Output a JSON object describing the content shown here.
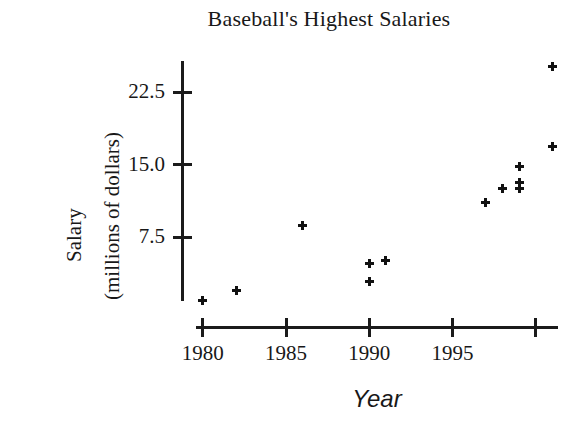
{
  "chart_data": {
    "type": "scatter",
    "title": "Baseball's Highest Salaries",
    "xlabel": "Year",
    "ylabel": "Salary\n(millions of dollars)",
    "ylabel_lines": [
      "Salary",
      "(millions of dollars)"
    ],
    "xlim": [
      1979.0,
      2001.5
    ],
    "ylim": [
      0.0,
      26.5
    ],
    "xticks": [
      1980,
      1985,
      1990,
      1995,
      2000
    ],
    "xtick_labels": [
      "1980",
      "1985",
      "1990",
      "1995",
      ""
    ],
    "yticks": [
      7.5,
      15.0,
      22.5
    ],
    "ytick_labels": [
      "7.5",
      "15.0",
      "22.5"
    ],
    "grid": false,
    "legend": null,
    "marker": "plus",
    "marker_color": "#111111",
    "x": [
      1980,
      1982,
      1986,
      1990,
      1990,
      1991,
      1997,
      1998,
      1999,
      1999,
      1999,
      2001,
      2001
    ],
    "y": [
      1.0,
      2.0,
      8.7,
      4.8,
      2.9,
      5.1,
      11.1,
      12.6,
      14.8,
      13.2,
      12.6,
      16.9,
      25.2
    ],
    "points": [
      {
        "year": 1980,
        "salary": 1.0
      },
      {
        "year": 1982,
        "salary": 2.0
      },
      {
        "year": 1986,
        "salary": 8.7
      },
      {
        "year": 1990,
        "salary": 4.8
      },
      {
        "year": 1990,
        "salary": 2.9
      },
      {
        "year": 1991,
        "salary": 5.1
      },
      {
        "year": 1997,
        "salary": 11.1
      },
      {
        "year": 1998,
        "salary": 12.6
      },
      {
        "year": 1999,
        "salary": 14.8
      },
      {
        "year": 1999,
        "salary": 13.2
      },
      {
        "year": 1999,
        "salary": 12.6
      },
      {
        "year": 2001,
        "salary": 16.9
      },
      {
        "year": 2001,
        "salary": 25.2
      }
    ]
  },
  "colors": {
    "background": "#ffffff",
    "ink": "#181818",
    "marker": "#111111"
  }
}
